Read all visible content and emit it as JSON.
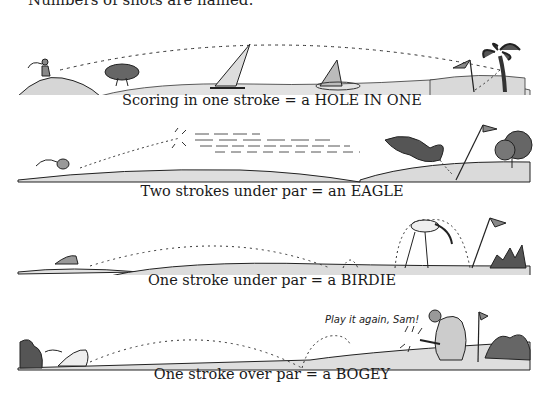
{
  "intro_text": "Numbers of shots are named:",
  "panels": [
    {
      "id": "hole-in-one",
      "caption": "Scoring in one stroke = a HOLE IN ONE"
    },
    {
      "id": "eagle",
      "caption": "Two strokes under par = an EAGLE"
    },
    {
      "id": "birdie",
      "caption": "One stroke under par = a BIRDIE"
    },
    {
      "id": "bogey",
      "caption": "One stroke over par = a BOGEY",
      "speech": "Play it again, Sam!"
    }
  ],
  "colors": {
    "ink": "#1a1a1a",
    "ground": "#d9d9d9",
    "ground_shadow": "#a8a8a8",
    "foliage": "#555555"
  }
}
